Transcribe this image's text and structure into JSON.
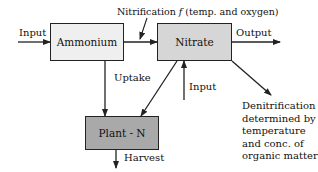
{
  "diagram": {
    "type": "nitrogen-flow-diagram",
    "colors": {
      "ammonium_fill": "#efefef",
      "nitrate_fill": "#d6d6d6",
      "plant_fill": "#a9a9a9",
      "stroke": "#222222"
    },
    "nodes": [
      {
        "id": "ammonium",
        "label": "Ammonium"
      },
      {
        "id": "nitrate",
        "label": "Nitrate"
      },
      {
        "id": "plant_n",
        "label": "Plant - N"
      }
    ],
    "edges": [
      {
        "from": "external",
        "to": "ammonium",
        "label": "Input"
      },
      {
        "from": "ammonium",
        "to": "nitrate",
        "label": "Nitrification f (temp. and oxygen)"
      },
      {
        "from": "nitrate",
        "to": "external",
        "label": "Output"
      },
      {
        "from": "ammonium",
        "to": "plant_n",
        "label": "Uptake"
      },
      {
        "from": "nitrate",
        "to": "plant_n",
        "label": ""
      },
      {
        "from": "external",
        "to": "nitrate",
        "label": "Input"
      },
      {
        "from": "nitrate",
        "to": "external",
        "label": "Denitrification determined by temperature and conc. of organic matter"
      },
      {
        "from": "plant_n",
        "to": "external",
        "label": "Harvest"
      }
    ]
  },
  "labels": {
    "input_left": "Input",
    "nitrification_prefix": "Nitrification ",
    "nitrification_f": "f",
    "nitrification_suffix": " (temp. and oxygen)",
    "output": "Output",
    "uptake": "Uptake",
    "input_lower": "Input",
    "denitrification": "Denitrification determined by temperature and conc. of organic matter",
    "harvest": "Harvest"
  }
}
